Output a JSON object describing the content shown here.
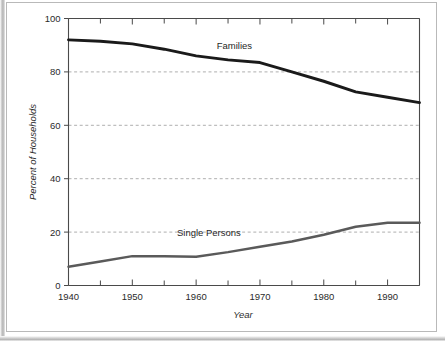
{
  "chart_data": {
    "type": "line",
    "title": "",
    "xlabel": "Year",
    "ylabel": "Percent of Households",
    "xlim": [
      1940,
      1995
    ],
    "ylim": [
      0,
      100
    ],
    "grid": "horizontal-dashed",
    "legend_position": "inline-labels",
    "x_ticks_major": [
      1940,
      1950,
      1960,
      1970,
      1980,
      1990
    ],
    "x_ticks_major_labels": [
      "1940",
      "1950",
      "1960",
      "1970",
      "1980",
      "1990"
    ],
    "x_ticks_minor": [
      1945,
      1955,
      1965,
      1975,
      1985,
      1995
    ],
    "y_ticks": [
      0,
      20,
      40,
      60,
      80,
      100
    ],
    "y_tick_labels": [
      "0",
      "20",
      "40",
      "60",
      "80",
      "100"
    ],
    "gridline_values": [
      20,
      40,
      60,
      80
    ],
    "x": [
      1940,
      1945,
      1950,
      1955,
      1960,
      1965,
      1970,
      1975,
      1980,
      1985,
      1990,
      1995
    ],
    "series": [
      {
        "name": "Families",
        "label": "Families",
        "color": "#1a1a1a",
        "label_x": 1966,
        "label_y": 88.5,
        "values": [
          92.0,
          91.5,
          90.5,
          88.5,
          86.0,
          84.5,
          83.5,
          80.0,
          76.5,
          72.5,
          70.5,
          68.5
        ]
      },
      {
        "name": "Single Persons",
        "label": "Single Persons",
        "color": "#5a5a5a",
        "label_x": 1962,
        "label_y": 18.5,
        "values": [
          7.0,
          9.0,
          11.0,
          11.0,
          10.8,
          12.5,
          14.5,
          16.5,
          19.0,
          22.0,
          23.5,
          23.5
        ]
      }
    ]
  },
  "axes": {
    "y_title": "Percent of Households",
    "x_title": "Year"
  }
}
